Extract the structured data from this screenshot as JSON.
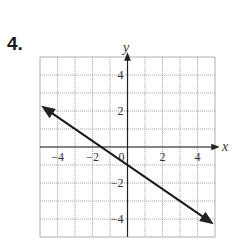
{
  "problem": {
    "number_label": "4."
  },
  "axes": {
    "x_label": "x",
    "y_label": "y",
    "origin_label": "0"
  },
  "colors": {
    "grid": "#9a9a9a",
    "axis": "#222222",
    "line": "#1a1a1a",
    "text": "#333333"
  },
  "chart_data": {
    "type": "line",
    "title": "",
    "xlabel": "x",
    "ylabel": "y",
    "xlim": [
      -5,
      5
    ],
    "ylim": [
      -5,
      5
    ],
    "grid": true,
    "x_ticks": [
      -4,
      -2,
      2,
      4
    ],
    "y_ticks": [
      4,
      2,
      -2,
      -4
    ],
    "x_tick_labels": [
      "−4",
      "−2",
      "2",
      "4"
    ],
    "y_tick_labels": [
      "4",
      "2",
      "−2",
      "−4"
    ],
    "series": [
      {
        "name": "line",
        "equation": "y = -2/3 x - 1",
        "x": [
          -4.8,
          -1.5,
          0,
          4.8
        ],
        "y": [
          2.2,
          0,
          -1,
          -4.2
        ],
        "arrows_both_ends": true
      }
    ],
    "legend": null
  }
}
